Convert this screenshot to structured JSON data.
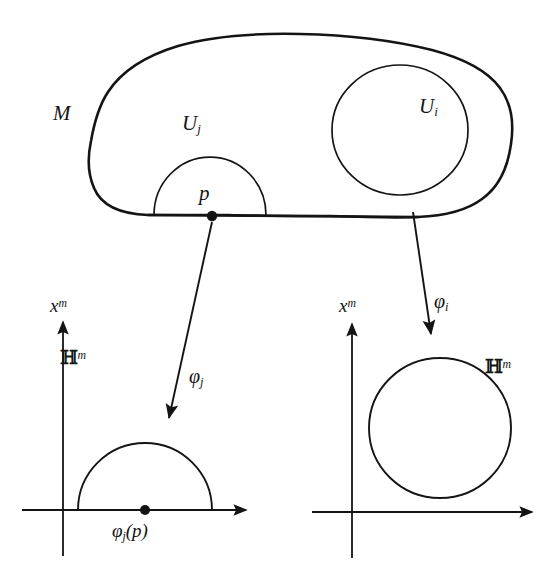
{
  "figure": {
    "caption": "",
    "background_color": "#ffffff",
    "ink_color": "#141414",
    "labels": {
      "manifold": "M",
      "chart_j": "U",
      "chart_j_sub": "j",
      "chart_i": "U",
      "chart_i_sub": "i",
      "point": "p",
      "map_j": "φ",
      "map_j_sub": "j",
      "map_i": "φ",
      "map_i_sub": "i",
      "axis_left": "x",
      "axis_left_sup": "m",
      "axis_right": "x",
      "axis_right_sup": "m",
      "halfspace_left": "ℍ",
      "halfspace_left_sup": "m",
      "halfspace_right": "ℍ",
      "halfspace_right_sup": "m",
      "image_point": "φ",
      "image_point_sub": "j",
      "image_point_arg": "(p)"
    },
    "shapes": {
      "manifold_outline": "irregular closed blob with straight lower boundary edge",
      "chart_j_region": "half-disc (semicircle) sitting on the boundary of M",
      "chart_i_region": "full disc in the interior of M",
      "left_image": "half-disc on the x-axis of the half-space H^m",
      "right_image": "full disc above the x-axis of the half-space H^m"
    },
    "arrows": [
      {
        "name": "phi-j-arrow",
        "from": [
          212,
          219
        ],
        "to": [
          168,
          421
        ],
        "label": "φ_j"
      },
      {
        "name": "phi-i-arrow",
        "from": [
          414,
          216
        ],
        "to": [
          431,
          337
        ],
        "label": "φ_i"
      }
    ],
    "axes": [
      {
        "name": "left-axes",
        "origin": [
          63,
          510
        ],
        "x_end": [
          248,
          510
        ],
        "y_end": [
          63,
          320
        ]
      },
      {
        "name": "right-axes",
        "origin": [
          352,
          512
        ],
        "x_end": [
          530,
          512
        ],
        "y_end": [
          352,
          322
        ]
      }
    ],
    "points": [
      {
        "name": "p-dot",
        "at": [
          212,
          216
        ]
      },
      {
        "name": "phi-j-p-dot",
        "at": [
          145,
          510
        ]
      }
    ]
  }
}
